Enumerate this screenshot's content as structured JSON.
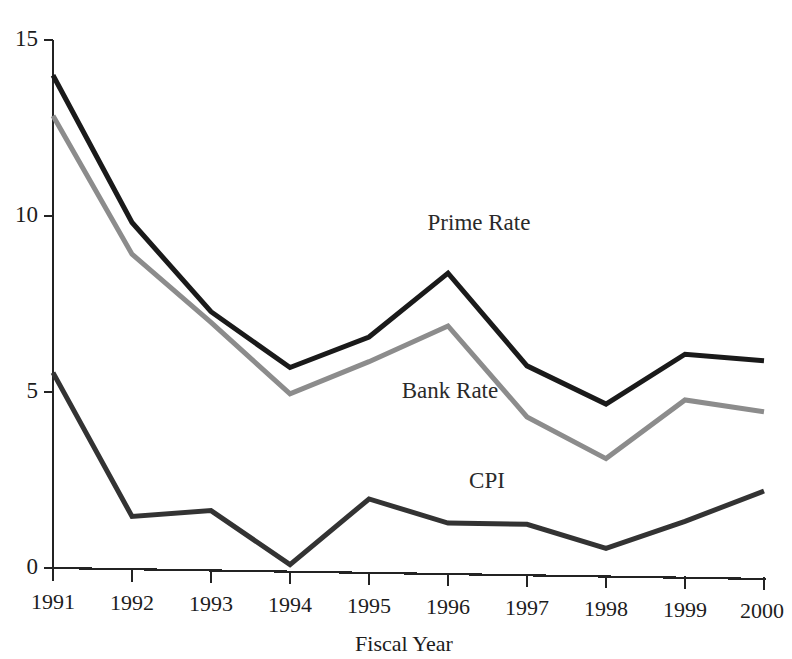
{
  "chart_data": {
    "type": "line",
    "title": "",
    "xlabel": "Fiscal Year",
    "ylabel": "",
    "categories": [
      "1991",
      "1992",
      "1993",
      "1994",
      "1995",
      "1996",
      "1997",
      "1998",
      "1999",
      "2000"
    ],
    "x": [
      1991,
      1992,
      1993,
      1994,
      1995,
      1996,
      1997,
      1998,
      1999,
      2000
    ],
    "xlim": [
      1991,
      2000
    ],
    "ylim": [
      0,
      15
    ],
    "yticks": [
      0,
      5,
      10,
      15
    ],
    "ytick_labels": [
      "0",
      "5",
      "10",
      "15"
    ],
    "grid": false,
    "legend_position": "inline-annotation",
    "series": [
      {
        "name": "Prime Rate",
        "color": "#1a1a1a",
        "line_width": 5,
        "values": [
          14.0,
          9.85,
          7.35,
          5.8,
          6.7,
          8.55,
          5.95,
          4.9,
          6.35,
          6.2
        ]
      },
      {
        "name": "Bank Rate",
        "color": "#8c8c8c",
        "line_width": 5,
        "values": [
          12.85,
          8.95,
          7.05,
          5.05,
          6.0,
          7.05,
          4.5,
          3.35,
          5.05,
          4.75
        ]
      },
      {
        "name": "CPI",
        "color": "#333333",
        "line_width": 5,
        "values": [
          5.55,
          1.5,
          1.7,
          0.2,
          2.1,
          1.45,
          1.45,
          0.8,
          1.6,
          2.5
        ]
      }
    ],
    "annotations": [
      {
        "text": "Prime Rate",
        "x_px": 479,
        "y_px": 230
      },
      {
        "text": "Bank Rate",
        "x_px": 450,
        "y_px": 398
      },
      {
        "text": "CPI",
        "x_px": 487,
        "y_px": 488
      }
    ]
  },
  "axes": {
    "y_axis_name": "value-axis",
    "x_axis_name": "fiscal-year-axis",
    "x_axis_title": "Fiscal Year"
  },
  "colors": {
    "prime_rate": "#1a1a1a",
    "bank_rate": "#8c8c8c",
    "cpi": "#333333",
    "axis": "#232323",
    "background": "#ffffff",
    "text": "#1c1c1c"
  }
}
